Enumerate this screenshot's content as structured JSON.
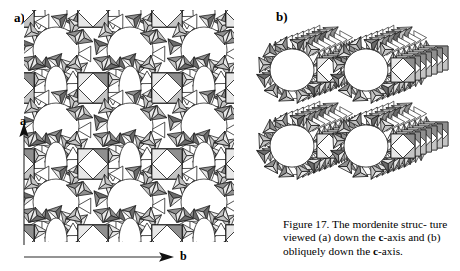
{
  "figure": {
    "panel_a_label": "a)",
    "panel_b_label": "b)",
    "caption_line1": "Figure 17. The mordenite struc-",
    "caption_line2_pre": "ture viewed  (a)  down the ",
    "caption_axis1": "c",
    "caption_line2_post": "-axis",
    "caption_line3_pre": "and (b) obliquely down the ",
    "caption_axis2": "c",
    "caption_line3_post": "-axis.",
    "caption_full": "Figure 17. The mordenite structure viewed (a) down the c-axis and (b) obliquely down the c-axis.",
    "axis_a_label": "a",
    "axis_b_label": "b",
    "subject": "mordenite",
    "structure_type": "zeolite framework",
    "panel_a_view": "down the c-axis",
    "panel_b_view": "obliquely down the c-axis"
  },
  "colors": {
    "background": "#ffffff",
    "outline": "#1a1a1a",
    "face_light": "#e8e8e8",
    "face_mid": "#c4c4c4",
    "face_dark": "#8f8f8f",
    "face_darker": "#6b6b6b",
    "text": "#000000",
    "axis_line": "#2b2b2b"
  },
  "chart_data": {
    "type": "diagram",
    "panels": [
      {
        "id": "a",
        "label": "a)",
        "view": "down the c-axis",
        "projection": "orthographic",
        "axes_shown": [
          "a",
          "b"
        ],
        "a_axis_direction": "up",
        "b_axis_direction": "right",
        "lattice": {
          "unit_cells_x": 3,
          "unit_cells_y": 3,
          "origin_x": 32,
          "origin_y": 14,
          "cell_width": 74,
          "cell_height": 76
        },
        "features": [
          "12-ring main channels (large circular pores)",
          "8-ring side pockets (narrow elliptical pores)",
          "4-ring units between channels",
          "5-ring chains (tetrahedra)"
        ]
      },
      {
        "id": "b",
        "label": "b)",
        "view": "obliquely down the c-axis",
        "projection": "oblique",
        "oblique_shear_x": 0.34,
        "oblique_depth_layers": 7,
        "layer_step_x": 5.5,
        "layer_step_y": -2.0,
        "origin_x": 14,
        "origin_y": 26,
        "cell_width": 74,
        "cell_height": 76,
        "unit_cells_x": 2,
        "unit_cells_y": 2
      }
    ],
    "shading_levels": [
      "#e8e8e8",
      "#c4c4c4",
      "#8f8f8f",
      "#6b6b6b"
    ]
  }
}
